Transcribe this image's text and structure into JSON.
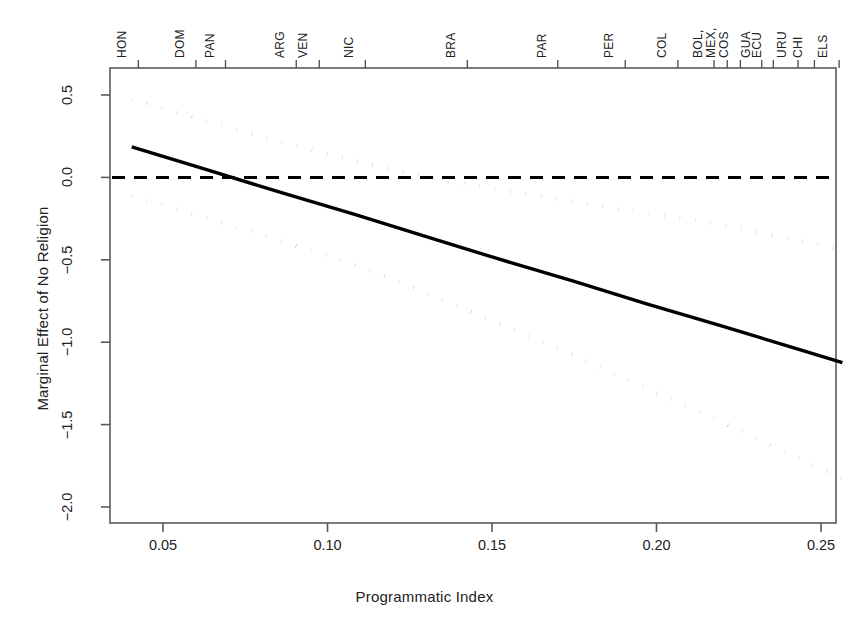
{
  "chart_data": {
    "type": "line",
    "title": "",
    "xlabel": "Programmatic Index",
    "ylabel": "Marginal Effect of No Religion",
    "xlim": [
      0.037,
      0.258
    ],
    "ylim": [
      -2.07,
      0.56
    ],
    "xticks": [
      0.05,
      0.1,
      0.15,
      0.2,
      0.25
    ],
    "xtick_labels": [
      "0.05",
      "0.10",
      "0.15",
      "0.20",
      "0.25"
    ],
    "yticks": [
      0.5,
      0.0,
      -0.5,
      -1.0,
      -1.5,
      -2.0
    ],
    "ytick_labels": [
      "0.5",
      "0.0",
      "-0.5",
      "-1.0",
      "-1.5",
      "-2.0"
    ],
    "grid": false,
    "legend": "none",
    "reference_line": {
      "y": 0.0,
      "style": "dashed",
      "color": "#000000"
    },
    "x": [
      0.0405,
      0.063,
      0.085,
      0.108,
      0.13,
      0.152,
      0.175,
      0.197,
      0.22,
      0.2425,
      0.2565
    ],
    "series": [
      {
        "name": "Marginal effect (point estimate)",
        "style": "solid",
        "color": "#000000",
        "values": [
          0.185,
          0.049,
          -0.087,
          -0.223,
          -0.359,
          -0.495,
          -0.631,
          -0.767,
          -0.903,
          -1.039,
          -1.124
        ]
      },
      {
        "name": "Upper 95% confidence bound",
        "style": "dotted",
        "color": "#000000",
        "values": [
          0.474,
          0.344,
          0.218,
          0.102,
          0.003,
          -0.076,
          -0.145,
          -0.215,
          -0.29,
          -0.377,
          -0.437
        ]
      },
      {
        "name": "Lower 95% confidence bound",
        "style": "dotted",
        "color": "#000000",
        "values": [
          -0.114,
          -0.243,
          -0.38,
          -0.53,
          -0.7,
          -0.885,
          -1.079,
          -1.28,
          -1.486,
          -1.695,
          -1.827
        ]
      }
    ],
    "top_axis": {
      "label": "Country rug (Programmatic Index values)",
      "ticks": [
        {
          "label": "HON",
          "value": 0.0425
        },
        {
          "label": "DOM",
          "value": 0.06
        },
        {
          "label": "PAN",
          "value": 0.069
        },
        {
          "label": "ARG",
          "value": 0.0905
        },
        {
          "label": "VEN",
          "value": 0.0975
        },
        {
          "label": "NIC",
          "value": 0.1115
        },
        {
          "label": "BRA",
          "value": 0.1425
        },
        {
          "label": "PAR",
          "value": 0.17
        },
        {
          "label": "PER",
          "value": 0.1905
        },
        {
          "label": "COL",
          "value": 0.2065
        },
        {
          "label": "BOL,",
          "value": 0.2175
        },
        {
          "label": "MEX,",
          "value": 0.2215
        },
        {
          "label": "COS",
          "value": 0.2255
        },
        {
          "label": "GUA",
          "value": 0.232
        },
        {
          "label": "ECU",
          "value": 0.2355
        },
        {
          "label": "URU",
          "value": 0.243
        },
        {
          "label": "CHI",
          "value": 0.248
        },
        {
          "label": "ELS",
          "value": 0.2555
        }
      ]
    }
  }
}
